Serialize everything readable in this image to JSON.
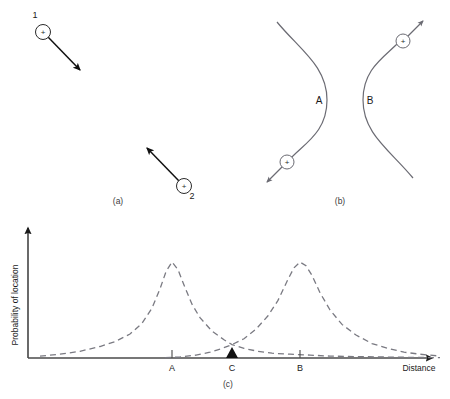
{
  "figure": {
    "panels": [
      {
        "id": "a",
        "caption": "(a)",
        "particles": [
          {
            "name": "1",
            "charge": "+",
            "cx": 43,
            "cy": 32,
            "arrow_to_x": 82,
            "arrow_to_y": 72,
            "label_x": 35,
            "label_y": 18
          },
          {
            "name": "2",
            "charge": "+",
            "cx": 184,
            "cy": 186,
            "arrow_to_x": 145,
            "arrow_to_y": 146,
            "label_x": 192,
            "label_y": 196
          }
        ]
      },
      {
        "id": "b",
        "caption": "(b)",
        "curves": [
          {
            "name": "A",
            "label_x": 319,
            "label_y": 104
          },
          {
            "name": "B",
            "label_x": 369,
            "label_y": 104
          }
        ],
        "particles": [
          {
            "name": "A-particle",
            "charge": "+",
            "cx": 287,
            "cy": 162,
            "arrow_to_x": 265,
            "arrow_to_y": 184
          },
          {
            "name": "B-particle",
            "charge": "+",
            "cx": 403,
            "cy": 41,
            "arrow_to_x": 423,
            "arrow_to_y": 20
          }
        ]
      },
      {
        "id": "c",
        "caption": "(c)",
        "axes": {
          "y_label": "Probability of location",
          "x_label": "Distance"
        },
        "ticks": [
          {
            "label": "A",
            "x": 172
          },
          {
            "label": "C",
            "x": 232
          },
          {
            "label": "B",
            "x": 300
          }
        ],
        "marker": {
          "name": "intersection-marker",
          "x": 232,
          "y": 348
        }
      }
    ]
  },
  "chart_data": {
    "type": "line",
    "title": "",
    "xlabel": "Distance",
    "ylabel": "Probability of location",
    "xlim": [
      0,
      450
    ],
    "ylim": [
      0,
      1
    ],
    "grid": false,
    "legend": "none",
    "tick_labels": [
      "A",
      "C",
      "B"
    ],
    "tick_positions": [
      172,
      232,
      300
    ],
    "annotations": [
      {
        "text": "intersection of the two distributions at C",
        "x": 232,
        "y": 0.13
      }
    ],
    "series": [
      {
        "name": "A",
        "style": "dashed",
        "peak_x": 172,
        "peak_y": 1.0,
        "x": [
          40,
          60,
          80,
          100,
          115,
          130,
          142,
          152,
          160,
          166,
          172,
          178,
          184,
          192,
          200,
          212,
          224,
          232,
          244,
          258,
          272,
          290,
          310,
          330,
          355,
          385,
          415,
          440
        ],
        "y": [
          0.02,
          0.04,
          0.07,
          0.12,
          0.17,
          0.25,
          0.36,
          0.52,
          0.72,
          0.9,
          1.0,
          0.92,
          0.76,
          0.56,
          0.42,
          0.28,
          0.19,
          0.14,
          0.1,
          0.07,
          0.05,
          0.04,
          0.03,
          0.02,
          0.015,
          0.01,
          0.006,
          0.003
        ]
      },
      {
        "name": "B",
        "style": "dashed",
        "peak_x": 300,
        "peak_y": 1.0,
        "x": [
          165,
          180,
          196,
          210,
          222,
          232,
          244,
          256,
          268,
          278,
          288,
          294,
          300,
          306,
          312,
          320,
          330,
          342,
          356,
          372,
          388,
          404,
          420,
          440
        ],
        "y": [
          0.003,
          0.01,
          0.03,
          0.06,
          0.1,
          0.14,
          0.2,
          0.3,
          0.44,
          0.6,
          0.82,
          0.94,
          1.0,
          0.96,
          0.86,
          0.68,
          0.5,
          0.35,
          0.24,
          0.15,
          0.1,
          0.06,
          0.04,
          0.02
        ]
      }
    ]
  },
  "colors": {
    "ink": "#1a1a1a",
    "curve": "#6b6b73",
    "axis": "#4a4a4a",
    "dashed": "#7a7a82"
  }
}
